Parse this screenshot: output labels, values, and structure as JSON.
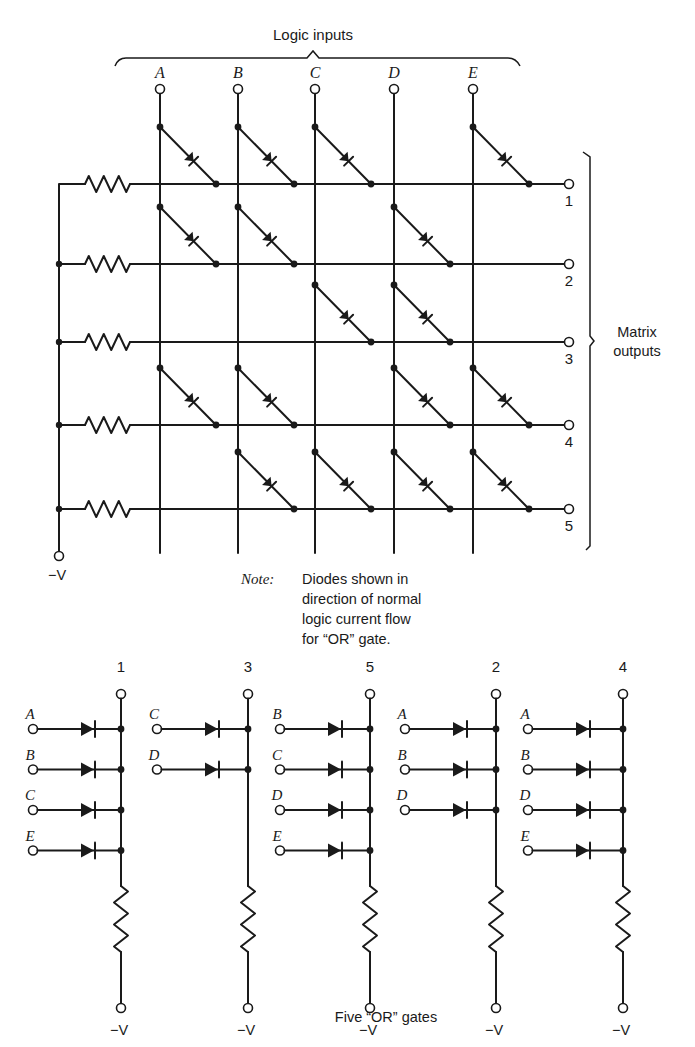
{
  "labels": {
    "logic_inputs": "Logic inputs",
    "matrix_outputs_line1": "Matrix",
    "matrix_outputs_line2": "outputs",
    "supply": "−V",
    "note_label": "Note:",
    "note_lines": [
      "Diodes shown in",
      "direction of normal",
      "logic current flow",
      "for “OR” gate."
    ],
    "gates_caption": "Five “OR” gates"
  },
  "matrix": {
    "inputs": [
      {
        "name": "A",
        "x": 160
      },
      {
        "name": "B",
        "x": 238
      },
      {
        "name": "C",
        "x": 315
      },
      {
        "name": "D",
        "x": 394
      },
      {
        "name": "E",
        "x": 473
      }
    ],
    "outputs": [
      {
        "name": "1",
        "y": 184,
        "inputs": [
          "A",
          "B",
          "C",
          "E"
        ]
      },
      {
        "name": "2",
        "y": 264,
        "inputs": [
          "A",
          "B",
          "D"
        ]
      },
      {
        "name": "3",
        "y": 342,
        "inputs": [
          "C",
          "D"
        ]
      },
      {
        "name": "4",
        "y": 425,
        "inputs": [
          "A",
          "B",
          "D",
          "E"
        ]
      },
      {
        "name": "5",
        "y": 509,
        "inputs": [
          "B",
          "C",
          "D",
          "E"
        ]
      }
    ],
    "rail_x": 59,
    "output_terminal_x": 569,
    "input_terminal_y": 89,
    "column_bottom_y": 553,
    "supply_terminal_y": 556
  },
  "or_gates": [
    {
      "output": "1",
      "bus_x": 121,
      "input_x": 33,
      "inputs": [
        "A",
        "B",
        "C",
        "E"
      ]
    },
    {
      "output": "3",
      "bus_x": 248,
      "input_x": 157,
      "inputs": [
        "C",
        "D"
      ]
    },
    {
      "output": "5",
      "bus_x": 370,
      "input_x": 280,
      "inputs": [
        "B",
        "C",
        "D",
        "E"
      ]
    },
    {
      "output": "2",
      "bus_x": 496,
      "input_x": 405,
      "inputs": [
        "A",
        "B",
        "D"
      ]
    },
    {
      "output": "4",
      "bus_x": 623,
      "input_x": 528,
      "inputs": [
        "A",
        "B",
        "D",
        "E"
      ]
    }
  ],
  "or_gate_layout": {
    "label_y": 672,
    "top_terminal_y": 694,
    "first_input_y": 729,
    "input_spacing": 40.5,
    "resistor_top_y": 886,
    "resistor_bottom_y": 952,
    "bottom_terminal_y": 1008,
    "supply_label_y": 1035
  }
}
